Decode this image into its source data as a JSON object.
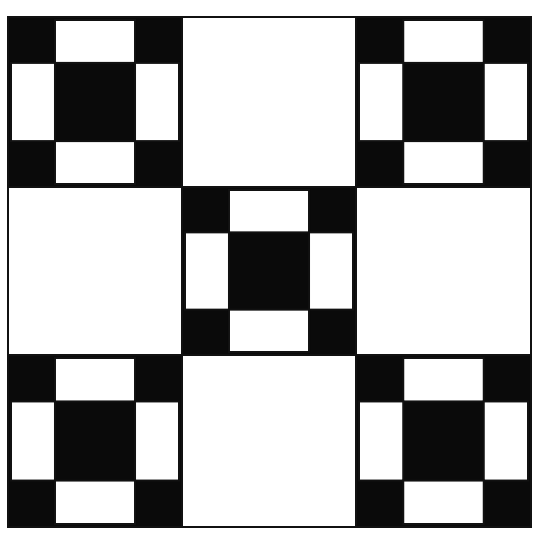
{
  "diagram": {
    "colors": {
      "dark": "#0a0a0a",
      "light": "#ffffff",
      "outline": "#111111"
    },
    "frame": {
      "x": 8,
      "y": 17,
      "width": 523,
      "height": 510
    },
    "columns": [
      8,
      182,
      356,
      531
    ],
    "rows": [
      17,
      187,
      355,
      527
    ],
    "grid": [
      [
        "shoofly",
        "plain",
        "shoofly"
      ],
      [
        "plain",
        "shoofly",
        "plain"
      ],
      [
        "shoofly",
        "plain",
        "shoofly"
      ]
    ],
    "shoofly_pattern": {
      "description": "3x3 sub-grid: dark corners, light edge rectangles, dark center",
      "cells": [
        [
          "dark",
          "light",
          "dark"
        ],
        [
          "light",
          "dark",
          "light"
        ],
        [
          "dark",
          "light",
          "dark"
        ]
      ],
      "proportions": [
        0.27,
        0.46,
        0.27
      ],
      "inset": 3
    }
  }
}
